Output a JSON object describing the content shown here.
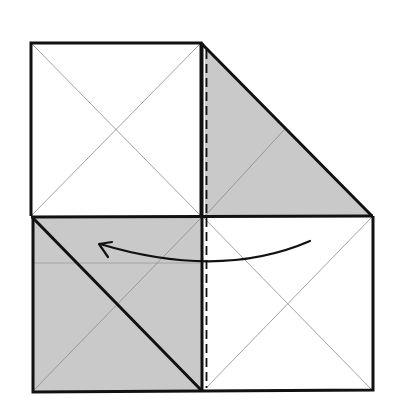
{
  "diagram": {
    "colors": {
      "background": "#ffffff",
      "paper_white": "#ffffff",
      "paper_colored": "#c9c9c9",
      "edge": "#111111",
      "crease": "#8a8a8a"
    },
    "panels": [
      {
        "id": "top-left-square",
        "fill": "white",
        "x": 31,
        "y": 43,
        "w": 170,
        "h": 173
      },
      {
        "id": "top-right-triangle",
        "fill": "colored"
      },
      {
        "id": "bottom-left-square",
        "fill": "colored",
        "x": 33,
        "y": 217,
        "w": 169,
        "h": 174
      },
      {
        "id": "bottom-right-square",
        "fill": "white",
        "x": 202,
        "y": 216,
        "w": 171,
        "h": 175
      }
    ],
    "fold_line": {
      "type": "valley",
      "style": "dashed",
      "x": 206
    },
    "arrow": {
      "direction": "right-to-left",
      "meaning": "fold over"
    }
  }
}
